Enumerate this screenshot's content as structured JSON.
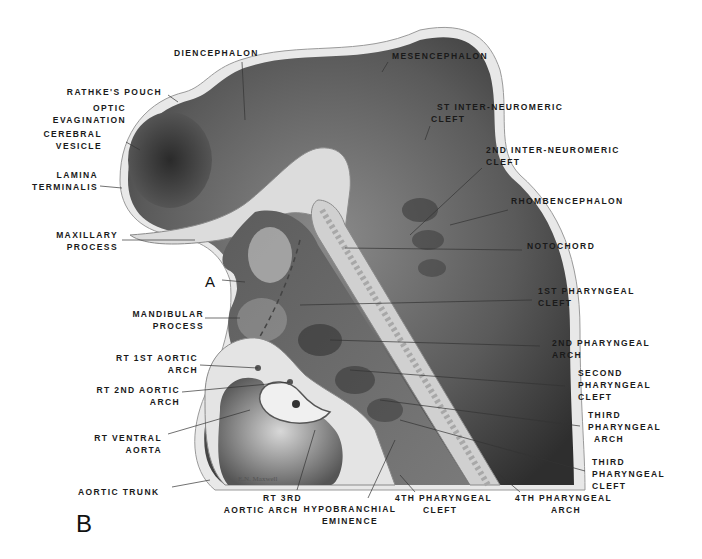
{
  "figure": {
    "panel_letter": "B",
    "point_marker": "A",
    "signature": "E.N. Maxwell"
  },
  "labels": {
    "diencephalon": [
      "DIENCEPHALON"
    ],
    "mesencephalon": [
      "MESENCEPHALON"
    ],
    "rathkes_pouch": [
      "RATHKE'S POUCH"
    ],
    "optic_evagination": [
      "OPTIC",
      "EVAGINATION"
    ],
    "cerebral_vesicle": [
      "CEREBRAL",
      "VESICLE"
    ],
    "lamina_terminalis": [
      "LAMINA",
      "TERMINALIS"
    ],
    "first_inter_neuromeric_cleft": [
      "ST INTER-NEUROMERIC",
      "CLEFT"
    ],
    "second_inter_neuromeric_cleft": [
      "2ND INTER-NEUROMERIC",
      "CLEFT"
    ],
    "rhombencephalon": [
      "RHOMBENCEPHALON"
    ],
    "notochord": [
      "NOTOCHORD"
    ],
    "maxillary_process": [
      "MAXILLARY",
      "PROCESS"
    ],
    "mandibular_process": [
      "MANDIBULAR",
      "PROCESS"
    ],
    "first_pharyngeal_cleft": [
      "1ST PHARYNGEAL",
      "CLEFT"
    ],
    "second_pharyngeal_arch": [
      "2ND PHARYNGEAL",
      "ARCH"
    ],
    "second_pharyngeal_cleft": [
      "SECOND",
      "PHARYNGEAL",
      "CLEFT"
    ],
    "third_pharyngeal_arch": [
      "THIRD",
      "PHARYNGEAL",
      "ARCH"
    ],
    "third_pharyngeal_cleft": [
      "THIRD",
      "PHARYNGEAL",
      "CLEFT"
    ],
    "rt_first_aortic_arch": [
      "RT 1ST AORTIC",
      "ARCH"
    ],
    "rt_second_aortic_arch": [
      "RT 2ND AORTIC",
      "ARCH"
    ],
    "rt_ventral_aorta": [
      "RT VENTRAL",
      "AORTA"
    ],
    "aortic_trunk": [
      "AORTIC TRUNK"
    ],
    "rt_third_aortic_arch": [
      "RT 3RD",
      "AORTIC ARCH"
    ],
    "hypobranchial_eminence": [
      "HYPOBRANCHIAL",
      "EMINENCE"
    ],
    "fourth_pharyngeal_cleft": [
      "4TH PHARYNGEAL",
      "CLEFT"
    ],
    "fourth_pharyngeal_arch": [
      "4TH PHARYNGEAL",
      "ARCH"
    ]
  },
  "colors": {
    "tissue_dark": "#3a3a3a",
    "tissue_mid": "#6e6e6e",
    "membrane": "#e6e6e6",
    "ink": "#1a1a1a"
  }
}
